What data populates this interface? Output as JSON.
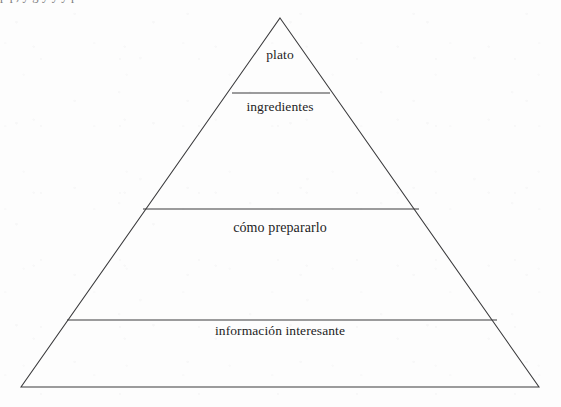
{
  "page": {
    "background_color": "#fdfdfd",
    "ink_color": "#3a3a3c",
    "cropped_top_line": "p        p, y          g        y            y            y p"
  },
  "diagram": {
    "type": "pyramid",
    "name": "pyramid-diagram",
    "apex": {
      "x": 280,
      "y": 18
    },
    "base_left": {
      "x": 21,
      "y": 387
    },
    "base_right": {
      "x": 539,
      "y": 387
    },
    "tiers": [
      {
        "index": 0,
        "label": "plato",
        "divider_y": 93,
        "divider_left_x": 232,
        "divider_right_x": 330,
        "label_x": 280,
        "label_y": 55
      },
      {
        "index": 1,
        "label": "ingredientes",
        "divider_y": 209,
        "divider_left_x": 143,
        "divider_right_x": 419,
        "label_x": 280,
        "label_y": 107
      },
      {
        "index": 2,
        "label": "cómo prepararlo",
        "divider_y": 320,
        "divider_left_x": 67,
        "divider_right_x": 497,
        "label_x": 280,
        "label_y": 228
      },
      {
        "index": 3,
        "label": "información interesante",
        "divider_y": null,
        "divider_left_x": null,
        "divider_right_x": null,
        "label_x": 280,
        "label_y": 331
      }
    ]
  }
}
